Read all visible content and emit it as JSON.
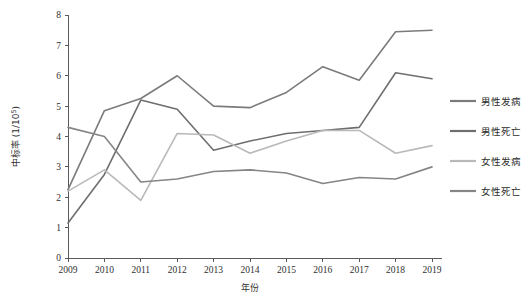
{
  "chart_data": {
    "type": "line",
    "title": "",
    "xlabel": "年份",
    "ylabel": "中标率 (1/10⁵)",
    "ylabel_main": "中标率",
    "ylabel_unit": "(1/10",
    "ylabel_exp": "5",
    "ylabel_close": ")",
    "x": [
      2009,
      2010,
      2011,
      2012,
      2013,
      2014,
      2015,
      2016,
      2017,
      2018,
      2019
    ],
    "categories": [
      "2009",
      "2010",
      "2011",
      "2012",
      "2013",
      "2014",
      "2015",
      "2016",
      "2017",
      "2018",
      "2019"
    ],
    "xlim": [
      2009,
      2019
    ],
    "ylim": [
      0,
      8
    ],
    "yticks": [
      0,
      1,
      2,
      3,
      4,
      5,
      6,
      7,
      8
    ],
    "ytick_labels": [
      "0",
      "1",
      "2",
      "3",
      "4",
      "5",
      "6",
      "7",
      "8"
    ],
    "grid": false,
    "legend_position": "right",
    "series": [
      {
        "name": "男性发病",
        "color": "#7b7b7b",
        "values": [
          2.25,
          4.85,
          5.25,
          6.0,
          5.0,
          4.95,
          5.45,
          6.3,
          5.85,
          7.45,
          7.5
        ]
      },
      {
        "name": "男性死亡",
        "color": "#6e6e6e",
        "values": [
          1.15,
          2.75,
          5.2,
          4.9,
          3.55,
          3.85,
          4.1,
          4.2,
          4.3,
          6.1,
          5.9
        ]
      },
      {
        "name": "女性发病",
        "color": "#b9b9b9",
        "values": [
          2.2,
          2.9,
          1.9,
          4.1,
          4.05,
          3.45,
          3.85,
          4.2,
          4.2,
          3.45,
          3.7
        ]
      },
      {
        "name": "女性死亡",
        "color": "#858585",
        "values": [
          4.3,
          4.0,
          2.5,
          2.6,
          2.85,
          2.9,
          2.8,
          2.45,
          2.65,
          2.6,
          3.0
        ]
      }
    ]
  },
  "legend": {
    "entries": [
      {
        "label": "男性发病",
        "color": "#7b7b7b"
      },
      {
        "label": "男性死亡",
        "color": "#6e6e6e"
      },
      {
        "label": "女性发病",
        "color": "#b9b9b9"
      },
      {
        "label": "女性死亡",
        "color": "#858585"
      }
    ]
  },
  "axes": {
    "x_title": "年份",
    "y_title": "中标率 (1/10⁵)"
  }
}
